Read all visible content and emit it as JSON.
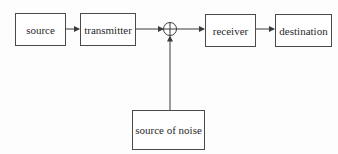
{
  "diagram": {
    "title": "",
    "nodes": [
      {
        "id": "source",
        "label": "source"
      },
      {
        "id": "transmitter",
        "label": "transmitter"
      },
      {
        "id": "summing_junction",
        "label": "+"
      },
      {
        "id": "receiver",
        "label": "receiver"
      },
      {
        "id": "destination",
        "label": "destination"
      },
      {
        "id": "noise",
        "label": "source of noise"
      }
    ],
    "edges": [
      {
        "from": "source",
        "to": "transmitter"
      },
      {
        "from": "transmitter",
        "to": "summing_junction"
      },
      {
        "from": "noise",
        "to": "summing_junction"
      },
      {
        "from": "summing_junction",
        "to": "receiver"
      },
      {
        "from": "receiver",
        "to": "destination"
      }
    ]
  },
  "labels": {
    "source": "source",
    "transmitter": "transmitter",
    "receiver": "receiver",
    "destination": "destination",
    "noise": "source of noise"
  }
}
